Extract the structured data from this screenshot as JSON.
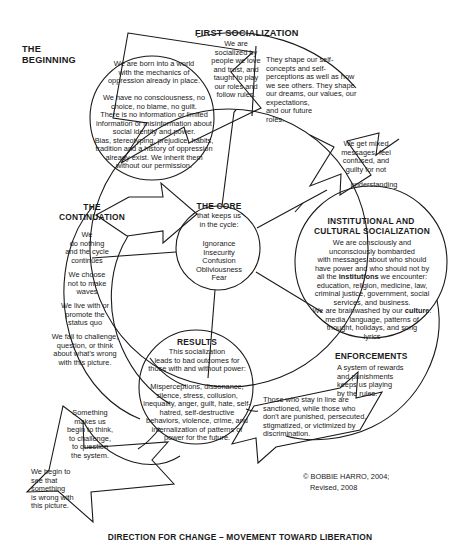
{
  "document": {
    "title": "Cycle of Socialization",
    "caption": "DIRECTION FOR CHANGE – MOVEMENT TOWARD LIBERATION",
    "copyright_line1": "© BOBBIE HARRO, 2004;",
    "copyright_line2": "Revised, 2008"
  },
  "nodes": {
    "beginning": {
      "heading": "THE\nBEGINNING",
      "body": "We are born into a world\nwith the mechanics of\noppression already in place.\n\nWe have no consciousness, no\nchoice, no blame, no guilt.\nThere is no information or limited\ninformation or misinformation about\nsocial identity and power.\nBias, stereotyping, prejudice, habits,\ntradition and a history of oppression\nalready exist. We inherit them\nwithout our permission."
    },
    "first_socialization": {
      "heading": "FIRST SOCIALIZATION",
      "body_left": "We are\nsocialized by\npeople we love\nand trust, and\ntaught to play\nour roles and\nfollow rules.",
      "body_right": "They shape our self-\nconcepts and self-\nperceptions as well as how\nwe see others.  They shape\nour dreams, our values, our\nexpectations,\nand our future\nroles.",
      "body_arrow": "We get mixed\nmessages, feel\nconfused, and\nguilty for not",
      "body_arrow2": "understanding"
    },
    "institutional": {
      "heading_line1": "INSTITUTIONAL AND",
      "heading_line2": "CULTURAL SOCIALIZATION",
      "body_part1": "We are consciously and\nunconsciously bombarded\nwith messages about who should\nhave power and who should not by\nall the ",
      "body_bold1": "institutions",
      "body_part2": " we encounter:\neducation, religion, medicine, law,\ncriminal justice, government, social\nservices, and business.\nWe are brainwashed by our ",
      "body_bold2": "culture",
      "body_part3": ":\nmedia, language, patterns of\nthought, holidays, and song\nlyrics"
    },
    "enforcements": {
      "heading": "ENFORCEMENTS",
      "body": "A system of rewards\nand punishments\nkeeps us playing\nby the rules.",
      "body_outer": "Those who stay in line are\nsanctioned, while those who\ndon't are punished, persecuted,\nstigmatized, or victimized by\ndiscrimination."
    },
    "results": {
      "heading": "RESULTS",
      "body_top": "This socialization\nleads to bad outcomes for\nthose with and without power:",
      "body_bottom": "Misperceptions, dissonance,\nsilence, stress, collusion,\ninequality, anger, guilt, hate, self-\nhatred, self-destructive\nbehaviors, violence, crime, and\ninternalization of patterns of\npower for the future."
    },
    "continuation": {
      "heading": "THE\nCONTINUATION",
      "body1": "We\ndo nothing\nand the cycle\ncontinues",
      "body2": "We choose\nnot to make\nwaves",
      "body3": "We live with or\npromote the\nstatus quo",
      "body4": "We fail to challenge,\nquestion, or think\nabout what's wrong\nwith this picture."
    },
    "core": {
      "heading": "THE CORE",
      "subheading": "that keeps us\nin the cycle:",
      "body": "Ignorance\nInsecurity\nConfusion\nObliviousness\nFear"
    },
    "change": {
      "body1": "Something\nmakes us\nbegin to think,\nto challenge,\nto question\nthe system.",
      "body2": "We begin to\nsee that\nsomething\nis wrong with\nthis picture."
    }
  },
  "colors": {
    "stroke": "#1a1a1a",
    "background": "#ffffff",
    "text": "#1a1a1a"
  }
}
